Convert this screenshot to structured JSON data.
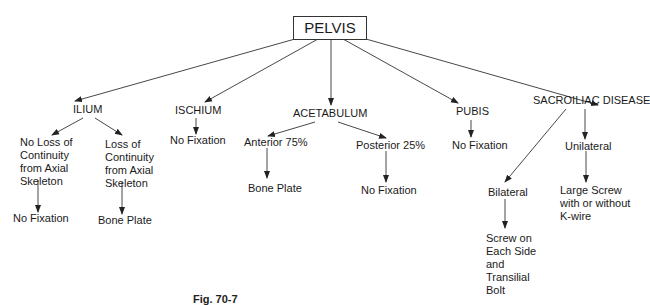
{
  "diagram": {
    "root": {
      "id": "pelvis",
      "label": "PELVIS"
    },
    "nodes": {
      "ilium": "ILIUM",
      "ischium": "ISCHIUM",
      "acetabulum": "ACETABULUM",
      "pubis": "PUBIS",
      "sacroiliac": "SACROILIAC DISEASE",
      "ilium_no_loss": [
        "No Loss of",
        "Continuity",
        "from Axial",
        "Skeleton"
      ],
      "ilium_loss": [
        "Loss of",
        "Continuity",
        "from Axial",
        "Skeleton"
      ],
      "ilium_no_loss_result": "No Fixation",
      "ilium_loss_result": "Bone Plate",
      "ischium_result": "No Fixation",
      "acetabulum_anterior": "Anterior 75%",
      "acetabulum_posterior": "Posterior 25%",
      "anterior_result": "Bone Plate",
      "posterior_result": "No Fixation",
      "pubis_result": "No Fixation",
      "sacroiliac_bilateral": "Bilateral",
      "sacroiliac_unilateral": "Unilateral",
      "bilateral_result": [
        "Screw on",
        "Each Side",
        "and",
        "Transilial",
        "Bolt"
      ],
      "unilateral_result": [
        "Large Screw",
        "with or without",
        "K-wire"
      ]
    },
    "edges": [
      [
        "pelvis",
        "ilium"
      ],
      [
        "pelvis",
        "ischium"
      ],
      [
        "pelvis",
        "acetabulum"
      ],
      [
        "pelvis",
        "pubis"
      ],
      [
        "pelvis",
        "sacroiliac"
      ],
      [
        "ilium",
        "ilium_no_loss"
      ],
      [
        "ilium",
        "ilium_loss"
      ],
      [
        "ilium_no_loss",
        "ilium_no_loss_result"
      ],
      [
        "ilium_loss",
        "ilium_loss_result"
      ],
      [
        "ischium",
        "ischium_result"
      ],
      [
        "acetabulum",
        "acetabulum_anterior"
      ],
      [
        "acetabulum",
        "acetabulum_posterior"
      ],
      [
        "acetabulum_anterior",
        "anterior_result"
      ],
      [
        "acetabulum_posterior",
        "posterior_result"
      ],
      [
        "pubis",
        "pubis_result"
      ],
      [
        "sacroiliac",
        "sacroiliac_bilateral"
      ],
      [
        "sacroiliac",
        "sacroiliac_unilateral"
      ],
      [
        "sacroiliac_bilateral",
        "bilateral_result"
      ],
      [
        "sacroiliac_unilateral",
        "unilateral_result"
      ]
    ],
    "caption": "Fig. 70-7"
  }
}
